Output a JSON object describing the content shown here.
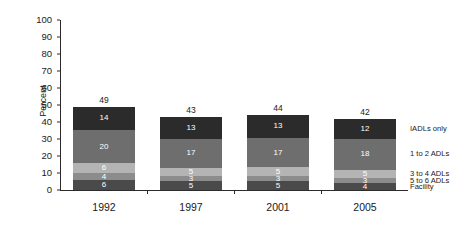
{
  "chart_data": {
    "type": "bar",
    "stacked": true,
    "title": "",
    "xlabel": "",
    "ylabel": "Percent",
    "ylim": [
      0,
      100
    ],
    "ytick_step": 10,
    "yticks": [
      0,
      10,
      20,
      30,
      40,
      50,
      60,
      70,
      80,
      90,
      100
    ],
    "ytick_labels": [
      "0",
      "10",
      "20",
      "30",
      "40",
      "50",
      "60",
      "70",
      "80",
      "90",
      "100"
    ],
    "categories": [
      "1992",
      "1997",
      "2001",
      "2005"
    ],
    "grid": false,
    "legend_position": "right",
    "totals": [
      49,
      43,
      44,
      42
    ],
    "series": [
      {
        "name": "IADLs only",
        "color": "#2b2b2b",
        "values": [
          14,
          13,
          13,
          12
        ]
      },
      {
        "name": "1 to 2 ADLs",
        "color": "#6e6e6e",
        "values": [
          20,
          17,
          17,
          18
        ]
      },
      {
        "name": "3 to 4 ADLs",
        "color": "#b4b4b4",
        "values": [
          6,
          5,
          5,
          5
        ]
      },
      {
        "name": "5 to 6 ADLs",
        "color": "#8c8c8c",
        "values": [
          4,
          3,
          3,
          3
        ]
      },
      {
        "name": "Facility",
        "color": "#4a4a4a",
        "values": [
          6,
          5,
          5,
          4
        ]
      }
    ],
    "legend_entries": [
      {
        "label": "IADLs only",
        "color": "#2b2b2b"
      },
      {
        "label": "1 to 2 ADLs",
        "color": "#6e6e6e"
      },
      {
        "label": "3 to 4 ADLs",
        "color": "#b4b4b4"
      },
      {
        "label": "5 to 6 ADLs",
        "color": "#8c8c8c"
      },
      {
        "label": "Facility",
        "color": "#4a4a4a"
      }
    ]
  }
}
